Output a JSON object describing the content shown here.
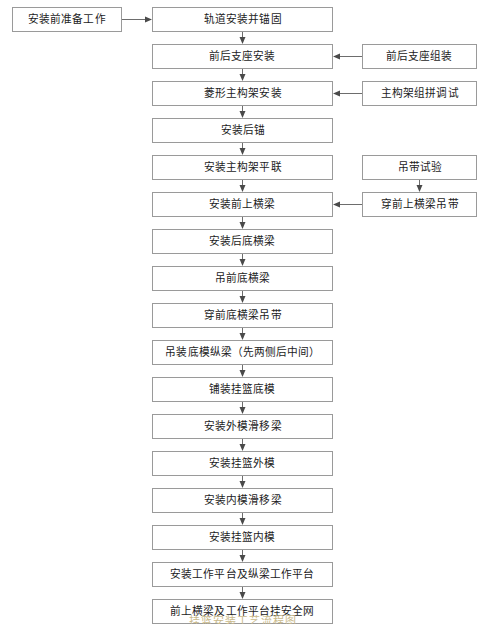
{
  "diagram": {
    "title": "挂篮安装工艺流程图",
    "type": "flowchart",
    "orientation": "top-to-bottom",
    "border_color": "#9a9a9a",
    "arrow_color": "#4a4a4a",
    "text_color": "#1c1c1c",
    "background_color": "#ffffff"
  },
  "start_node": {
    "id": "n0",
    "label": "安装前准备工作"
  },
  "main_nodes": [
    {
      "id": "m1",
      "label": "轨道安装并锚固"
    },
    {
      "id": "m2",
      "label": "前后支座安装"
    },
    {
      "id": "m3",
      "label": "菱形主构架安装"
    },
    {
      "id": "m4",
      "label": "安装后锚"
    },
    {
      "id": "m5",
      "label": "安装主构架平联"
    },
    {
      "id": "m6",
      "label": "安装前上横梁"
    },
    {
      "id": "m7",
      "label": "安装后底横梁"
    },
    {
      "id": "m8",
      "label": "吊前底横梁"
    },
    {
      "id": "m9",
      "label": "穿前底横梁吊带"
    },
    {
      "id": "m10",
      "label": "吊装底模纵梁（先两侧后中间）"
    },
    {
      "id": "m11",
      "label": "铺装挂篮底模"
    },
    {
      "id": "m12",
      "label": "安装外模滑移梁"
    },
    {
      "id": "m13",
      "label": "安装挂篮外模"
    },
    {
      "id": "m14",
      "label": "安装内模滑移梁"
    },
    {
      "id": "m15",
      "label": "安装挂篮内模"
    },
    {
      "id": "m16",
      "label": "安装工作平台及纵梁工作平台"
    },
    {
      "id": "m17",
      "label": "前上横梁及工作平台挂安全网"
    }
  ],
  "side_nodes": [
    {
      "id": "s1",
      "label": "前后支座组装",
      "target": "m2"
    },
    {
      "id": "s2",
      "label": "主构架组拼调试",
      "target": "m3"
    },
    {
      "id": "s3",
      "label": "吊带试验",
      "target": "s4"
    },
    {
      "id": "s4",
      "label": "穿前上横梁吊带",
      "target": "m6"
    }
  ],
  "caption": {
    "text": "挂篮安装工艺流程图"
  }
}
